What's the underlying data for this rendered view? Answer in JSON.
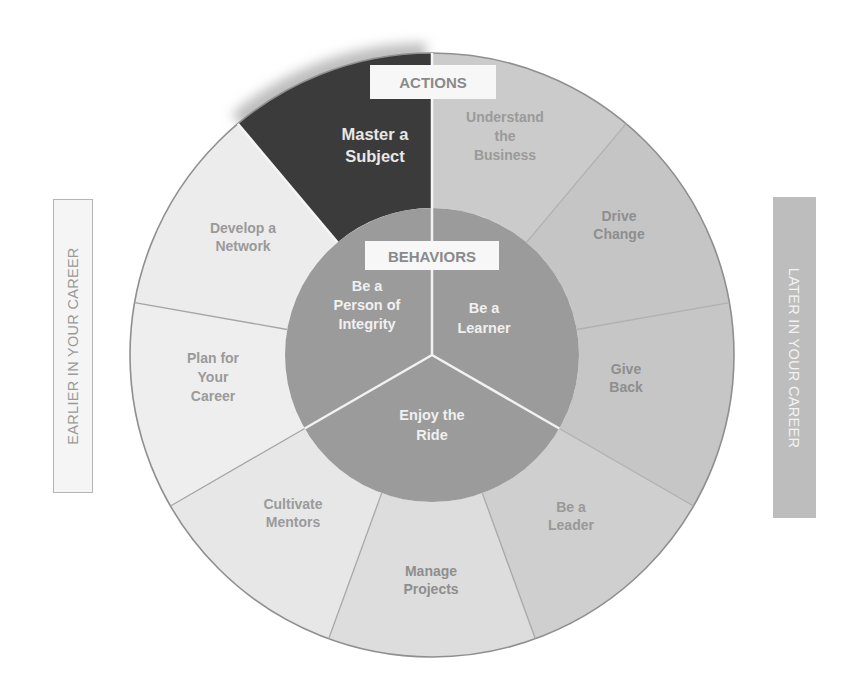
{
  "diagram": {
    "title_actions": "ACTIONS",
    "title_behaviors": "BEHAVIORS",
    "left_label": "EARLIER IN YOUR CAREER",
    "right_label": "LATER IN YOUR CAREER",
    "actions": [
      {
        "id": "master",
        "lines": [
          "Master a",
          "Subject"
        ],
        "fill": "#3b3b3b",
        "text_color": "#e8e8e8"
      },
      {
        "id": "understand",
        "lines": [
          "Understand",
          "the",
          "Business"
        ],
        "fill": "#cbcbcb",
        "text_color": "#9a9a9a"
      },
      {
        "id": "drive",
        "lines": [
          "Drive",
          "Change"
        ],
        "fill": "#c5c5c5",
        "text_color": "#8e8e8e"
      },
      {
        "id": "give",
        "lines": [
          "Give",
          "Back"
        ],
        "fill": "#c6c6c6",
        "text_color": "#8e8e8e"
      },
      {
        "id": "leader",
        "lines": [
          "Be a",
          "Leader"
        ],
        "fill": "#cfcfcf",
        "text_color": "#999999"
      },
      {
        "id": "projects",
        "lines": [
          "Manage",
          "Projects"
        ],
        "fill": "#dddddd",
        "text_color": "#8e8e8e"
      },
      {
        "id": "mentors",
        "lines": [
          "Cultivate",
          "Mentors"
        ],
        "fill": "#e7e7e7",
        "text_color": "#9a9a9a"
      },
      {
        "id": "plan",
        "lines": [
          "Plan for",
          "Your",
          "Career"
        ],
        "fill": "#eeeeee",
        "text_color": "#9a9a9a"
      },
      {
        "id": "network",
        "lines": [
          "Develop a",
          "Network"
        ],
        "fill": "#ececec",
        "text_color": "#9a9a9a"
      }
    ],
    "behaviors": [
      {
        "id": "integrity",
        "lines": [
          "Be a",
          "Person of",
          "Integrity"
        ]
      },
      {
        "id": "learner",
        "lines": [
          "Be a",
          "Learner"
        ]
      },
      {
        "id": "ride",
        "lines": [
          "Enjoy the",
          "Ride"
        ]
      }
    ],
    "colors": {
      "inner_circle": "#9b9b9b",
      "inner_text": "#f0f0f0",
      "label_box": "#f7f7f7",
      "label_text": "#8a8a8a",
      "divider_light": "#f5f5f5",
      "divider_dark": "#aaaaaa",
      "outline": "#8f8f8f"
    }
  }
}
